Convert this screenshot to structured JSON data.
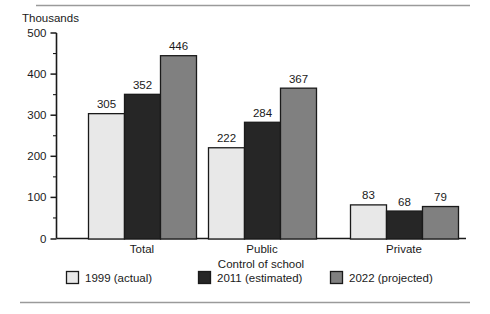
{
  "chart_data": {
    "type": "bar",
    "title": "",
    "unit_label": "Thousands",
    "xlabel": "Control of school",
    "ylabel": "",
    "categories": [
      "Total",
      "Public",
      "Private"
    ],
    "series": [
      {
        "name": "1999 (actual)",
        "values": [
          305,
          222,
          83
        ],
        "color": "#e8e8e8"
      },
      {
        "name": "2011 (estimated)",
        "values": [
          352,
          284,
          68
        ],
        "color": "#262626"
      },
      {
        "name": "2022 (projected)",
        "values": [
          446,
          367,
          79
        ],
        "color": "#808080"
      }
    ],
    "ylim": [
      0,
      500
    ],
    "ytick_labels": [
      "0",
      "100",
      "200",
      "300",
      "400",
      "500"
    ],
    "ytick_values": [
      0,
      100,
      200,
      300,
      400,
      500
    ],
    "yminor_step": 50,
    "grid": false,
    "legend_position": "bottom",
    "value_labels_shown": true
  },
  "legend": {
    "items": [
      {
        "label": "1999 (actual)",
        "color": "#e8e8e8"
      },
      {
        "label": "2011 (estimated)",
        "color": "#262626"
      },
      {
        "label": "2022 (projected)",
        "color": "#808080"
      }
    ]
  },
  "decor": {
    "top_rule": true,
    "bottom_rule": true,
    "rule_color": "#9a9a9a"
  }
}
